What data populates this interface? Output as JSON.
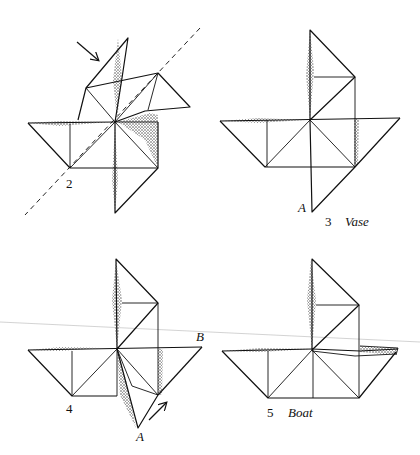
{
  "figures": [
    {
      "id": "step-2",
      "step_label": "2",
      "caption": ""
    },
    {
      "id": "step-3",
      "step_label": "3",
      "caption": "Vase",
      "point_label": "A"
    },
    {
      "id": "step-4",
      "step_label": "4",
      "point_labels": [
        "A",
        "B"
      ]
    },
    {
      "id": "step-5",
      "step_label": "5",
      "caption": "Boat"
    }
  ],
  "colors": {
    "ink": "#111111",
    "paper": "#ffffff",
    "scan_line": "#c8c8c8"
  }
}
